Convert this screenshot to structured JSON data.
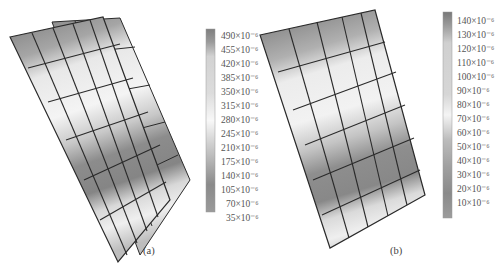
{
  "figure": {
    "panels": [
      {
        "id": "a",
        "caption": "(a)",
        "colorbar": {
          "labels": [
            "490×10⁻⁶",
            "455×10⁻⁶",
            "420×10⁻⁶",
            "385×10⁻⁶",
            "350×10⁻⁶",
            "315×10⁻⁶",
            "280×10⁻⁶",
            "245×10⁻⁶",
            "210×10⁻⁶",
            "175×10⁻⁶",
            "140×10⁻⁶",
            "105×10⁻⁶",
            "70×10⁻⁶",
            "35×10⁻⁶"
          ],
          "values": [
            490,
            455,
            420,
            385,
            350,
            315,
            280,
            245,
            210,
            175,
            140,
            105,
            70,
            35
          ],
          "unit_exponent": -6
        }
      },
      {
        "id": "b",
        "caption": "(b)",
        "colorbar": {
          "labels": [
            "140×10⁻⁶",
            "130×10⁻⁶",
            "120×10⁻⁶",
            "110×10⁻⁶",
            "100×10⁻⁶",
            "90×10⁻⁶",
            "80×10⁻⁶",
            "70×10⁻⁶",
            "60×10⁻⁶",
            "50×10⁻⁶",
            "40×10⁻⁶",
            "30×10⁻⁶",
            "20×10⁻⁶",
            "10×10⁻⁶"
          ],
          "values": [
            140,
            130,
            120,
            110,
            100,
            90,
            80,
            70,
            60,
            50,
            40,
            30,
            20,
            10
          ],
          "unit_exponent": -6
        }
      }
    ],
    "colors": {
      "grid_line": "#2a2a2a",
      "high": "#7a7a7a",
      "mid": "#b8b8b8",
      "low": "#f2f2f2"
    }
  }
}
